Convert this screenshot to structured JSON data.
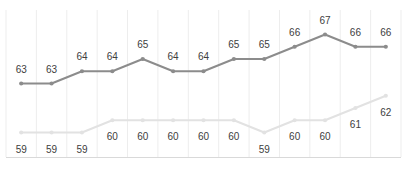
{
  "chart_data": {
    "type": "line",
    "title": "",
    "subtitle": "",
    "xlabel": "",
    "ylabel": "",
    "grid": "vertical",
    "legend_position": "none",
    "x": [
      1,
      2,
      3,
      4,
      5,
      6,
      7,
      8,
      9,
      10,
      11,
      12,
      13
    ],
    "categories": [
      "",
      "",
      "",
      "",
      "",
      "",
      "",
      "",
      "",
      "",
      "",
      "",
      ""
    ],
    "ylim": [
      57,
      69
    ],
    "series": [
      {
        "name": "upper-series",
        "color": "#8c8c8c",
        "marker": "circle",
        "label_position": "above",
        "values": [
          63,
          63,
          64,
          64,
          65,
          64,
          64,
          65,
          65,
          66,
          67,
          66,
          66
        ],
        "labels": [
          "63",
          "63",
          "64",
          "64",
          "65",
          "64",
          "64",
          "65",
          "65",
          "66",
          "67",
          "66",
          "66"
        ]
      },
      {
        "name": "lower-series",
        "color": "#e2e2e2",
        "marker": "circle",
        "label_position": "below",
        "values": [
          59,
          59,
          59,
          60,
          60,
          60,
          60,
          60,
          59,
          60,
          60,
          61,
          62
        ],
        "labels": [
          "59",
          "59",
          "59",
          "60",
          "60",
          "60",
          "60",
          "60",
          "59",
          "60",
          "60",
          "61",
          "62"
        ]
      }
    ],
    "axis_color": "#d9d9d9",
    "gridline_color": "#ededed",
    "label_color": "#404040",
    "background": "#ffffff"
  }
}
